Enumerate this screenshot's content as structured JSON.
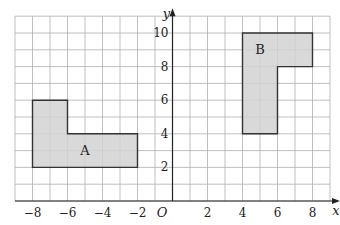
{
  "diagram": {
    "type": "coordinate-grid",
    "x_range": [
      -9,
      9
    ],
    "y_range": [
      0,
      11
    ],
    "origin_label": "O",
    "x_axis_label": "x",
    "y_axis_label": "y",
    "x_tick_labels": [
      {
        "value": -8,
        "text": "−8"
      },
      {
        "value": -6,
        "text": "−6"
      },
      {
        "value": -4,
        "text": "−4"
      },
      {
        "value": -2,
        "text": "−2"
      },
      {
        "value": 2,
        "text": "2"
      },
      {
        "value": 4,
        "text": "4"
      },
      {
        "value": 6,
        "text": "6"
      },
      {
        "value": 8,
        "text": "8"
      }
    ],
    "y_tick_labels": [
      {
        "value": 2,
        "text": "2"
      },
      {
        "value": 4,
        "text": "4"
      },
      {
        "value": 6,
        "text": "6"
      },
      {
        "value": 8,
        "text": "8"
      },
      {
        "value": 10,
        "text": "10"
      }
    ],
    "shapes": [
      {
        "name": "A",
        "label": "A",
        "label_pos": [
          -5,
          3
        ],
        "vertices": [
          [
            -8,
            2
          ],
          [
            -8,
            6
          ],
          [
            -6,
            6
          ],
          [
            -6,
            4
          ],
          [
            -2,
            4
          ],
          [
            -2,
            2
          ]
        ]
      },
      {
        "name": "B",
        "label": "B",
        "label_pos": [
          5,
          9
        ],
        "vertices": [
          [
            4,
            4
          ],
          [
            4,
            10
          ],
          [
            8,
            10
          ],
          [
            8,
            8
          ],
          [
            6,
            8
          ],
          [
            6,
            4
          ]
        ]
      }
    ],
    "colors": {
      "grid": "#b0b0b0",
      "axis": "#222222",
      "shape_fill": "#d2d2d2",
      "shape_stroke": "#333333"
    }
  }
}
